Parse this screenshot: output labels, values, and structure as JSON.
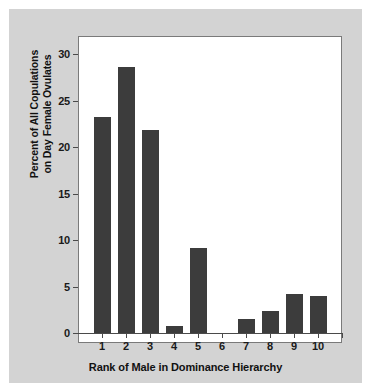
{
  "figure": {
    "background_color": "#d3d3d3",
    "plot_background_color": "#ffffff",
    "bar_color": "#3c3c3c",
    "axis_color": "#4a4a4a"
  },
  "chart_data": {
    "type": "bar",
    "title": "",
    "xlabel": "Rank of Male in Dominance Hierarchy",
    "ylabel": "Percent of All Copulations on Day Female Ovulates",
    "ylabel_lines": [
      "Percent of All Copulations",
      "on Day Female Ovulates"
    ],
    "categories": [
      "1",
      "2",
      "3",
      "4",
      "5",
      "6",
      "7",
      "8",
      "9",
      "10"
    ],
    "values": [
      23.3,
      28.6,
      21.8,
      0.7,
      9.1,
      0,
      1.5,
      2.4,
      4.2,
      4.0
    ],
    "ylim": [
      0,
      31
    ],
    "yticks": [
      0,
      5,
      10,
      15,
      20,
      25,
      30
    ],
    "ytick_labels": [
      "0",
      "5",
      "10",
      "15",
      "20",
      "25",
      "30"
    ],
    "grid": false,
    "legend": null,
    "legend_position": "none"
  }
}
